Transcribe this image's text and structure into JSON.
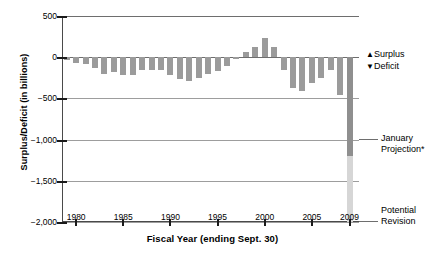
{
  "chart_data": {
    "type": "bar",
    "title": "",
    "xlabel": "Fiscal Year (ending Sept. 30)",
    "ylabel": "Surplus/Deficit (in billions)",
    "ylim": [
      -2000,
      500
    ],
    "xlim": [
      1978.5,
      2010.0
    ],
    "grid": true,
    "yticks": [
      500,
      0,
      -500,
      -1000,
      -1500,
      -2000
    ],
    "ytick_labels": [
      "500",
      "0",
      "−500",
      "−1,000",
      "−1,500",
      "−2,000"
    ],
    "xticks": [
      1980,
      1985,
      1990,
      1995,
      2000,
      2005,
      2009
    ],
    "xtick_labels": [
      "1980",
      "1985",
      "1990",
      "1995",
      "2000",
      "2005",
      "2009"
    ],
    "categories": [
      1979,
      1980,
      1981,
      1982,
      1983,
      1984,
      1985,
      1986,
      1987,
      1988,
      1989,
      1990,
      1991,
      1992,
      1993,
      1994,
      1995,
      1996,
      1997,
      1998,
      1999,
      2000,
      2001,
      2002,
      2003,
      2004,
      2005,
      2006,
      2007,
      2008,
      2009
    ],
    "values": [
      -40,
      -74,
      -79,
      -128,
      -208,
      -185,
      -212,
      -221,
      -150,
      -155,
      -153,
      -221,
      -269,
      -290,
      -255,
      -203,
      -164,
      -107,
      -22,
      69,
      126,
      236,
      128,
      -158,
      -378,
      -413,
      -318,
      -248,
      -161,
      -455,
      -1200
    ],
    "series": [
      {
        "name": "Surplus/Deficit",
        "values": [
          -40,
          -74,
          -79,
          -128,
          -208,
          -185,
          -212,
          -221,
          -150,
          -155,
          -153,
          -221,
          -269,
          -290,
          -255,
          -203,
          -164,
          -107,
          -22,
          69,
          126,
          236,
          128,
          -158,
          -378,
          -413,
          -318,
          -248,
          -161,
          -455,
          -1200
        ]
      },
      {
        "name": "January Projection",
        "year": 2009,
        "value": -1200
      },
      {
        "name": "Potential Revision",
        "year": 2009,
        "value": -2000
      }
    ],
    "legend": [
      {
        "glyph": "▲",
        "label": "Surplus"
      },
      {
        "glyph": "▼",
        "label": "Deficit"
      }
    ],
    "legend_position": "right",
    "annotations": [
      {
        "name": "january-projection",
        "text_line1": "January",
        "text_line2": "Projection*",
        "value": -1200
      },
      {
        "name": "potential-revision",
        "text_line1": "Potential",
        "text_line2": "Revision",
        "value": -2000
      }
    ],
    "colors": {
      "bar": "#9b9b9b",
      "projection_bar": "#8f8f8f",
      "revision_bar": "#d6d6d6",
      "axis": "#4a4a4a",
      "grid": "#9d9d9d",
      "background": "#ffffff"
    }
  }
}
